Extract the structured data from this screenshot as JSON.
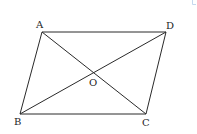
{
  "diagram": {
    "type": "parallelogram-with-diagonals",
    "stroke_color": "#2a2a2a",
    "points": {
      "A": {
        "label": "A",
        "x": 42,
        "y": 32
      },
      "D": {
        "label": "D",
        "x": 166,
        "y": 32
      },
      "B": {
        "label": "B",
        "x": 20,
        "y": 114
      },
      "C": {
        "label": "C",
        "x": 146,
        "y": 114
      },
      "O": {
        "label": "O",
        "x": 93,
        "y": 73
      }
    },
    "segments": [
      "AD",
      "BC",
      "AB",
      "DC",
      "AC",
      "BD"
    ],
    "labels": {
      "A": "A",
      "B": "B",
      "C": "C",
      "D": "D",
      "O": "O"
    }
  }
}
